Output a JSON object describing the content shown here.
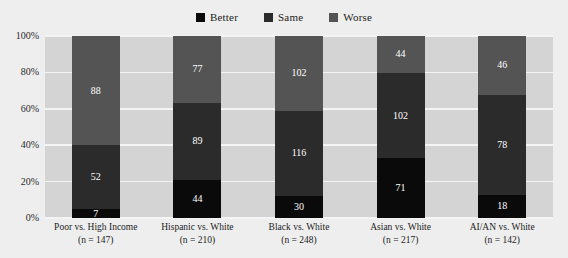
{
  "chart_data": {
    "type": "bar",
    "stacked": true,
    "title": "",
    "subtitle": "",
    "xlabel": "",
    "ylabel": "",
    "ylim": [
      0,
      100
    ],
    "y_unit": "percent",
    "grid": true,
    "legend_position": "top-center",
    "y_ticks": [
      "0%",
      "20%",
      "40%",
      "60%",
      "80%",
      "100%"
    ],
    "categories": [
      "Poor vs. High Income",
      "Hispanic vs. White",
      "Black vs. White",
      "Asian vs. White",
      "AI/AN vs. White"
    ],
    "category_counts": [
      "(n = 147)",
      "(n = 210)",
      "(n = 248)",
      "(n = 217)",
      "(n = 142)"
    ],
    "totals": [
      147,
      210,
      248,
      217,
      142
    ],
    "series": [
      {
        "name": "Better",
        "color": "#0a0a0a",
        "values": [
          7,
          44,
          30,
          71,
          18
        ]
      },
      {
        "name": "Same",
        "color": "#2b2b2b",
        "values": [
          52,
          89,
          116,
          102,
          78
        ]
      },
      {
        "name": "Worse",
        "color": "#545454",
        "values": [
          88,
          77,
          102,
          44,
          46
        ]
      }
    ],
    "data_labels": [
      {
        "category": "Poor vs. High Income",
        "Better": 7,
        "Same": 52,
        "Worse": 88
      },
      {
        "category": "Hispanic vs. White",
        "Better": 44,
        "Same": 89,
        "Worse": 77
      },
      {
        "category": "Black vs. White",
        "Better": 30,
        "Same": 116,
        "Worse": 102
      },
      {
        "category": "Asian vs. White",
        "Better": 71,
        "Same": 102,
        "Worse": 44
      },
      {
        "category": "AI/AN vs. White",
        "Better": 18,
        "Same": 78,
        "Worse": 46
      }
    ]
  },
  "legend": {
    "items": [
      {
        "label": "Better",
        "color": "#0a0a0a"
      },
      {
        "label": "Same",
        "color": "#2b2b2b"
      },
      {
        "label": "Worse",
        "color": "#545454"
      }
    ]
  },
  "colors": {
    "page_background": "#eeeeee",
    "plot_background": "#d4d4d4",
    "gridline": "#f4f4f4",
    "label_text": "#1c1c1c",
    "bar_label_text": "#ffffff"
  }
}
